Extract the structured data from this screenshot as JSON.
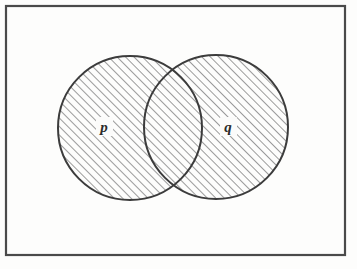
{
  "figure": {
    "kind": "venn-diagram",
    "title": "",
    "background_color": "#fdfdfc",
    "ink_color": "#3c3c3c",
    "frame": {
      "name": "universal-set-rectangle",
      "x": 6,
      "y": 6,
      "width": 339,
      "height": 249,
      "stroke_color": "#4a4a4a",
      "stroke_width": 2.2,
      "fill": "none"
    },
    "hatch": {
      "name": "diagonal-hatch-fill",
      "angle_degrees": 45,
      "direction": "lower-left-to-upper-right",
      "spacing": 6,
      "line_width": 1.1,
      "color": "#4a4a4a"
    },
    "sets": [
      {
        "id": "p",
        "name": "set-p-circle",
        "label": "p",
        "cx": 130,
        "cy": 128,
        "r": 72,
        "shaded": true,
        "label_x": 104,
        "label_y": 127
      },
      {
        "id": "q",
        "name": "set-q-circle",
        "label": "q",
        "cx": 216,
        "cy": 127,
        "r": 72,
        "shaded": true,
        "label_x": 228,
        "label_y": 127
      }
    ],
    "regions": {
      "intersection_shaded": true,
      "union_shaded": true,
      "outside_shaded": false,
      "description": "p union q shaded"
    }
  }
}
